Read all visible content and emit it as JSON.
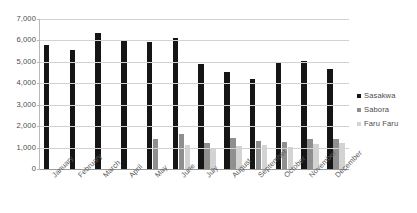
{
  "chart_data": {
    "type": "bar",
    "title": "",
    "xlabel": "",
    "ylabel": "",
    "ylim": [
      0,
      7000
    ],
    "yticks": [
      "7,000",
      "6,000",
      "5,000",
      "4,000",
      "3,000",
      "2,000",
      "1,000",
      "0"
    ],
    "ytick_values": [
      7000,
      6000,
      5000,
      4000,
      3000,
      2000,
      1000,
      0
    ],
    "grid": true,
    "legend_position": "right",
    "categories": [
      "January",
      "February",
      "March",
      "April",
      "May",
      "June",
      "July",
      "August",
      "September",
      "October",
      "November",
      "December"
    ],
    "series": [
      {
        "name": "Sasakwa",
        "color": "#151515",
        "values": [
          5800,
          5570,
          6350,
          6020,
          5950,
          6100,
          4920,
          4550,
          4220,
          5000,
          5020,
          4650
        ]
      },
      {
        "name": "Sabora",
        "color": "#8f8f8f",
        "values": [
          0,
          0,
          0,
          0,
          1400,
          1620,
          1200,
          1450,
          1330,
          1280,
          1400,
          1420
        ]
      },
      {
        "name": "Faru Faru",
        "color": "#d3d3d3",
        "values": [
          0,
          0,
          0,
          0,
          0,
          1100,
          1000,
          1080,
          1100,
          1050,
          1160,
          1200
        ]
      }
    ]
  },
  "legend": {
    "items": [
      {
        "label": "Sasakwa"
      },
      {
        "label": "Sabora"
      },
      {
        "label": "Faru Faru"
      }
    ]
  }
}
